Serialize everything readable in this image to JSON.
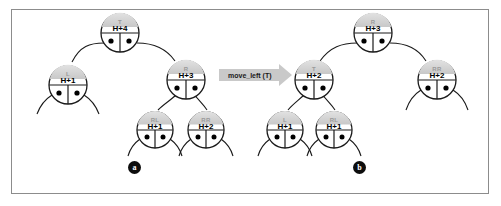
{
  "figure": {
    "transition_label": "move_left (T)",
    "panels": [
      {
        "marker": "a",
        "nodes": [
          {
            "id": "T",
            "label": "T",
            "height": "H+4"
          },
          {
            "id": "L",
            "label": "L",
            "height": "H+1"
          },
          {
            "id": "R",
            "label": "R",
            "height": "H+3"
          },
          {
            "id": "RL",
            "label": "RL",
            "height": "H+1"
          },
          {
            "id": "RR",
            "label": "RR",
            "height": "H+2"
          }
        ]
      },
      {
        "marker": "b",
        "nodes": [
          {
            "id": "R",
            "label": "R",
            "height": "H+3"
          },
          {
            "id": "T",
            "label": "T",
            "height": "H+2"
          },
          {
            "id": "RR",
            "label": "RR",
            "height": "H+2"
          },
          {
            "id": "L",
            "label": "L",
            "height": "H+1"
          },
          {
            "id": "RL",
            "label": "RL",
            "height": "H+1"
          }
        ]
      }
    ],
    "colors": {
      "node_fill_top": "#d2d2d2",
      "node_fill_bottom": "#ffffff",
      "node_stroke": "#1a1a1a",
      "arrow_fill": "#c9c9c9",
      "frame_border": "#8c8c8c",
      "marker_fill": "#0d0d0d"
    }
  }
}
